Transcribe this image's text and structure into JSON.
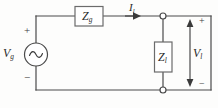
{
  "figure": {
    "kind": "circuit-schematic",
    "title": "",
    "colors": {
      "wire": "#4a4a4a",
      "box_stroke": "#6b6b6b",
      "text": "#2b2b2b",
      "background": "#fdfdfc"
    }
  },
  "components": {
    "source": {
      "label": "V",
      "subscript": "g",
      "symbol": "ac-sine-source",
      "plus_sign": "+",
      "minus_sign": "−"
    },
    "series_impedance": {
      "label": "Z",
      "subscript": "g"
    },
    "load_impedance": {
      "label": "Z",
      "subscript": "l"
    },
    "current": {
      "label": "I",
      "subscript": "l",
      "direction": "right"
    },
    "output_voltage": {
      "label": "V",
      "subscript": "l",
      "plus_sign": "+",
      "minus_sign": "−"
    },
    "terminals": {
      "top_node": "open-circle-terminal",
      "bottom_node": "open-circle-terminal"
    }
  }
}
